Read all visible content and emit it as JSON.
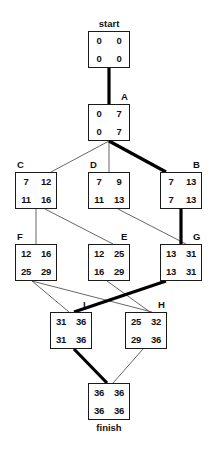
{
  "diagram": {
    "type": "activity-on-node-network",
    "width": 210,
    "height": 452,
    "background_color": "#ffffff",
    "line_color": "#1b1b1b",
    "critical_path_color": "#000000",
    "normal_edge_color": "#555555",
    "start_caption": "start",
    "finish_caption": "finish"
  },
  "nodes": [
    {
      "id": "start",
      "label": "start",
      "label_position": "above-center",
      "x": 88,
      "y": 31,
      "w": 42,
      "h": 37,
      "top_left": "0",
      "top_right": "0",
      "bottom_left": "0",
      "bottom_right": "0",
      "critical": true
    },
    {
      "id": "A",
      "label": "A",
      "label_position": "above-right",
      "x": 88,
      "y": 104,
      "w": 42,
      "h": 37,
      "top_left": "0",
      "top_right": "7",
      "bottom_left": "0",
      "bottom_right": "7",
      "critical": true
    },
    {
      "id": "C",
      "label": "C",
      "label_position": "above-left",
      "x": 15,
      "y": 172,
      "w": 42,
      "h": 37,
      "top_left": "7",
      "top_right": "12",
      "bottom_left": "11",
      "bottom_right": "16",
      "critical": false
    },
    {
      "id": "D",
      "label": "D",
      "label_position": "above-left",
      "x": 88,
      "y": 172,
      "w": 42,
      "h": 37,
      "top_left": "7",
      "top_right": "9",
      "bottom_left": "11",
      "bottom_right": "13",
      "critical": false
    },
    {
      "id": "B",
      "label": "B",
      "label_position": "above-right",
      "x": 160,
      "y": 172,
      "w": 42,
      "h": 37,
      "top_left": "7",
      "top_right": "13",
      "bottom_left": "7",
      "bottom_right": "13",
      "critical": true
    },
    {
      "id": "F",
      "label": "F",
      "label_position": "above-left",
      "x": 15,
      "y": 244,
      "w": 42,
      "h": 37,
      "top_left": "12",
      "top_right": "16",
      "bottom_left": "25",
      "bottom_right": "29",
      "critical": false
    },
    {
      "id": "E",
      "label": "E",
      "label_position": "above-right",
      "x": 88,
      "y": 244,
      "w": 42,
      "h": 37,
      "top_left": "12",
      "top_right": "25",
      "bottom_left": "16",
      "bottom_right": "29",
      "critical": false
    },
    {
      "id": "G",
      "label": "G",
      "label_position": "above-right",
      "x": 160,
      "y": 244,
      "w": 42,
      "h": 37,
      "top_left": "13",
      "top_right": "31",
      "bottom_left": "13",
      "bottom_right": "31",
      "critical": true
    },
    {
      "id": "I",
      "label": "I",
      "label_position": "above-right",
      "x": 50,
      "y": 312,
      "w": 42,
      "h": 37,
      "top_left": "31",
      "top_right": "36",
      "bottom_left": "31",
      "bottom_right": "36",
      "critical": true
    },
    {
      "id": "H",
      "label": "H",
      "label_position": "above-right",
      "x": 125,
      "y": 312,
      "w": 42,
      "h": 37,
      "top_left": "25",
      "top_right": "32",
      "bottom_left": "29",
      "bottom_right": "36",
      "critical": false
    },
    {
      "id": "finish",
      "label": "finish",
      "label_position": "below-center",
      "x": 88,
      "y": 383,
      "w": 42,
      "h": 37,
      "top_left": "36",
      "top_right": "36",
      "bottom_left": "36",
      "bottom_right": "36",
      "critical": true
    }
  ],
  "edges": [
    {
      "from": "start",
      "to": "A",
      "critical": true,
      "x1": 109,
      "y1": 68,
      "x2": 109,
      "y2": 104
    },
    {
      "from": "A",
      "to": "C",
      "critical": false,
      "x1": 109,
      "y1": 141,
      "x2": 51,
      "y2": 172
    },
    {
      "from": "A",
      "to": "D",
      "critical": false,
      "x1": 109,
      "y1": 141,
      "x2": 109,
      "y2": 172
    },
    {
      "from": "A",
      "to": "B",
      "critical": true,
      "x1": 109,
      "y1": 141,
      "x2": 166,
      "y2": 172
    },
    {
      "from": "C",
      "to": "F",
      "critical": false,
      "x1": 36,
      "y1": 209,
      "x2": 36,
      "y2": 244
    },
    {
      "from": "C",
      "to": "E",
      "critical": false,
      "x1": 45,
      "y1": 209,
      "x2": 113,
      "y2": 244
    },
    {
      "from": "D",
      "to": "G",
      "critical": false,
      "x1": 118,
      "y1": 209,
      "x2": 186,
      "y2": 244
    },
    {
      "from": "B",
      "to": "G",
      "critical": true,
      "x1": 181,
      "y1": 209,
      "x2": 181,
      "y2": 244
    },
    {
      "from": "F",
      "to": "I",
      "critical": false,
      "x1": 32,
      "y1": 281,
      "x2": 69,
      "y2": 312
    },
    {
      "from": "F",
      "to": "H",
      "critical": false,
      "x1": 32,
      "y1": 281,
      "x2": 152,
      "y2": 312
    },
    {
      "from": "E",
      "to": "H",
      "critical": false,
      "x1": 107,
      "y1": 281,
      "x2": 150,
      "y2": 312
    },
    {
      "from": "G",
      "to": "I",
      "critical": true,
      "x1": 166,
      "y1": 281,
      "x2": 74,
      "y2": 312
    },
    {
      "from": "I",
      "to": "finish",
      "critical": true,
      "x1": 74,
      "y1": 349,
      "x2": 107,
      "y2": 383
    },
    {
      "from": "H",
      "to": "finish",
      "critical": false,
      "x1": 143,
      "y1": 349,
      "x2": 113,
      "y2": 383
    }
  ]
}
